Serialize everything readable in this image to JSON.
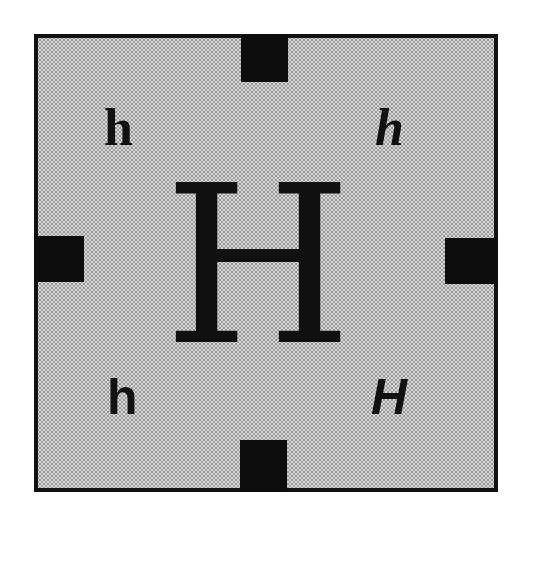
{
  "figure": {
    "background_color": "#ffffff",
    "frame": {
      "fill_color": "#d9d9d9",
      "border_color": "#111111",
      "pattern": "stipple"
    },
    "tabs": [
      {
        "position": "top",
        "color": "#0d0d0d"
      },
      {
        "position": "left",
        "color": "#0d0d0d"
      },
      {
        "position": "right",
        "color": "#0d0d0d"
      },
      {
        "position": "bottom",
        "color": "#0d0d0d"
      }
    ],
    "center_letter": {
      "text": "H",
      "style": "serif regular"
    },
    "corner_letters": {
      "top_left": {
        "text": "h",
        "style": "serif bold"
      },
      "top_right": {
        "text": "h",
        "style": "serif bold italic"
      },
      "bottom_left": {
        "text": "h",
        "style": "sans-serif bold"
      },
      "bottom_right": {
        "text": "H",
        "style": "sans-serif bold italic"
      }
    }
  }
}
